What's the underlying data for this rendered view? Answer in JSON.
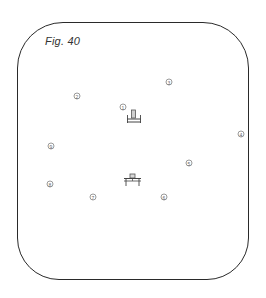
{
  "figure": {
    "title": "Fig. 40",
    "frame_color": "#2a2a2a",
    "markers": [
      {
        "id": "1",
        "label": "1",
        "x": 123,
        "y": 107
      },
      {
        "id": "2",
        "label": "2",
        "x": 77,
        "y": 96
      },
      {
        "id": "3",
        "label": "3",
        "x": 169,
        "y": 82
      },
      {
        "id": "4",
        "label": "4",
        "x": 241,
        "y": 134
      },
      {
        "id": "5",
        "label": "5",
        "x": 189,
        "y": 163
      },
      {
        "id": "6",
        "label": "6",
        "x": 164,
        "y": 197
      },
      {
        "id": "7",
        "label": "7",
        "x": 93,
        "y": 197
      },
      {
        "id": "8",
        "label": "8",
        "x": 50,
        "y": 184
      },
      {
        "id": "9",
        "label": "9",
        "x": 51,
        "y": 146
      }
    ],
    "symbols": [
      {
        "name": "upper-furniture-symbol",
        "x": 133,
        "y": 117
      },
      {
        "name": "lower-furniture-symbol",
        "x": 132,
        "y": 180
      }
    ]
  }
}
